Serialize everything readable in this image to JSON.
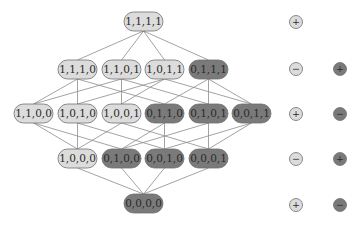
{
  "diagram": {
    "type": "hasse-lattice",
    "colors": {
      "light_fill": "#dcdcdc",
      "dark_fill": "#7a7a7a",
      "node_stroke": "#6e6e6e",
      "edge": "#8c8c8c",
      "text": "#2a2a2a",
      "background": "#ffffff"
    },
    "nodes": [
      {
        "id": "1111",
        "label": "1,1,1,1",
        "x": 124,
        "y": 12,
        "shade": "light"
      },
      {
        "id": "1110",
        "label": "1,1,1,0",
        "x": 58,
        "y": 60,
        "shade": "light"
      },
      {
        "id": "1101",
        "label": "1,1,0,1",
        "x": 102,
        "y": 60,
        "shade": "light"
      },
      {
        "id": "1011",
        "label": "1,0,1,1",
        "x": 145,
        "y": 60,
        "shade": "light"
      },
      {
        "id": "0111",
        "label": "0,1,1,1",
        "x": 189,
        "y": 60,
        "shade": "dark"
      },
      {
        "id": "1100",
        "label": "1,1,0,0",
        "x": 14,
        "y": 104,
        "shade": "light"
      },
      {
        "id": "1010",
        "label": "1,0,1,0",
        "x": 58,
        "y": 104,
        "shade": "light"
      },
      {
        "id": "1001",
        "label": "1,0,0,1",
        "x": 102,
        "y": 104,
        "shade": "light"
      },
      {
        "id": "0110",
        "label": "0,1,1,0",
        "x": 145,
        "y": 104,
        "shade": "dark"
      },
      {
        "id": "0101",
        "label": "0,1,0,1",
        "x": 189,
        "y": 104,
        "shade": "dark"
      },
      {
        "id": "0011",
        "label": "0,0,1,1",
        "x": 232,
        "y": 104,
        "shade": "dark"
      },
      {
        "id": "1000",
        "label": "1,0,0,0",
        "x": 58,
        "y": 149,
        "shade": "light"
      },
      {
        "id": "0100",
        "label": "0,1,0,0",
        "x": 102,
        "y": 149,
        "shade": "dark"
      },
      {
        "id": "0010",
        "label": "0,0,1,0",
        "x": 145,
        "y": 149,
        "shade": "dark"
      },
      {
        "id": "0001",
        "label": "0,0,0,1",
        "x": 189,
        "y": 149,
        "shade": "dark"
      },
      {
        "id": "0000",
        "label": "0,0,0,0",
        "x": 124,
        "y": 194,
        "shade": "dark"
      }
    ],
    "node_size": {
      "w": 39,
      "h": 19,
      "r": 9.5
    },
    "legend": {
      "rows": [
        {
          "y": 22,
          "light": "+",
          "dark": null
        },
        {
          "y": 69,
          "light": "−",
          "dark": "+"
        },
        {
          "y": 114,
          "light": "+",
          "dark": "−"
        },
        {
          "y": 159,
          "light": "−",
          "dark": "+"
        },
        {
          "y": 205,
          "light": "+",
          "dark": "−"
        }
      ],
      "light_cx": 296,
      "dark_cx": 340,
      "radius": 6.5
    }
  }
}
